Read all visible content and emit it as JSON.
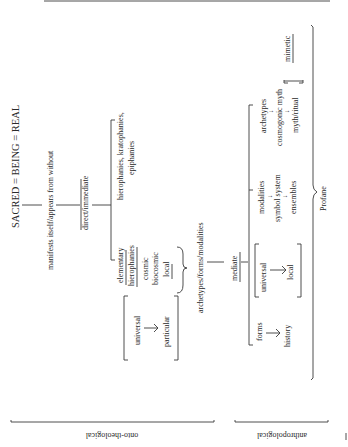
{
  "diagram": {
    "root": "SACRED = BEING = REAL",
    "level1": "manifests itself/appears from without",
    "direct": {
      "label": "direct/immediate",
      "branches": {
        "hierophanies": "hierophanies, kratophanies,",
        "hierophanies2": "epiphanies",
        "elementary1": "elementary",
        "elementary2": "hierophanies",
        "cosmic": "cosmic",
        "biocosmic": "biocosmic",
        "local": "local"
      }
    },
    "universal_particular": {
      "top": "universal",
      "arrow": "↓",
      "bottom": "particular"
    },
    "archetypes_forms": "archetypes/forms/modalities",
    "mediate": {
      "label": "mediate",
      "forms": "forms",
      "forms_arrow": "↓",
      "history": "history",
      "universal": "universal",
      "univ_arrow": "↓",
      "local": "local",
      "modalities": "modalities",
      "symbol_system": "symbol system",
      "ensembles": "ensembles",
      "archetypes": "archetypes",
      "cosmogonic_myth": "cosmogonic myth",
      "myth_ritual": "myth/ritual",
      "mimetic": "mimetic"
    },
    "profane": "Profane",
    "side_labels": {
      "onto": "onto-theological",
      "anthro": "anthropological"
    }
  }
}
